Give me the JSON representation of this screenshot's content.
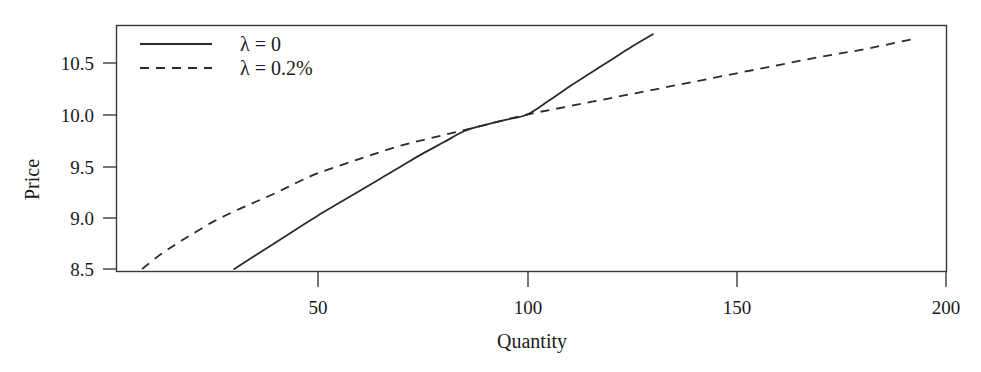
{
  "chart_data": {
    "type": "line",
    "title": "",
    "subtitle": "",
    "xlabel": "Quantity",
    "ylabel": "Price",
    "xlim": [
      5,
      200
    ],
    "ylim": [
      8.4,
      10.85
    ],
    "xticks": [
      50,
      100,
      150,
      200
    ],
    "xtick_labels": [
      "50",
      "100",
      "150",
      "200"
    ],
    "yticks": [
      8.5,
      9.0,
      9.5,
      10.0,
      10.5
    ],
    "ytick_labels": [
      "8.5",
      "10.0",
      "9.5",
      "9.0",
      "8.5"
    ],
    "ytick_labels_ordered": [
      "10.5",
      "10.0",
      "9.5",
      "9.0",
      "8.5"
    ],
    "grid": false,
    "legend_position": "top-left",
    "legend_entries": [
      "λ = 0",
      "λ = 0.2%"
    ],
    "annotations": [
      "Curves intersect at Quantity = 100, Price = 10.0"
    ],
    "series": [
      {
        "name": "λ = 0",
        "style": "solid",
        "color": "#2b2b2b",
        "x": [
          30,
          35,
          40,
          45,
          50,
          55,
          60,
          65,
          70,
          75,
          80,
          85,
          90,
          95,
          100,
          105,
          110,
          115,
          120,
          125,
          130
        ],
        "values": [
          8.5,
          8.63,
          8.76,
          8.89,
          9.02,
          9.14,
          9.26,
          9.38,
          9.5,
          9.62,
          9.73,
          9.84,
          9.9,
          9.95,
          10.0,
          10.13,
          10.27,
          10.4,
          10.53,
          10.66,
          10.78
        ]
      },
      {
        "name": "λ = 0.2%",
        "style": "dashed",
        "color": "#2b2b2b",
        "x": [
          8,
          12,
          16,
          20,
          25,
          30,
          35,
          40,
          45,
          50,
          60,
          70,
          80,
          90,
          100,
          110,
          120,
          130,
          140,
          150,
          160,
          170,
          180,
          193
        ],
        "values": [
          8.5,
          8.63,
          8.74,
          8.84,
          8.96,
          9.06,
          9.15,
          9.24,
          9.34,
          9.43,
          9.57,
          9.7,
          9.8,
          9.9,
          10.0,
          10.08,
          10.16,
          10.24,
          10.32,
          10.4,
          10.48,
          10.56,
          10.63,
          10.74
        ]
      }
    ]
  },
  "axes": {
    "ytick_labels": [
      "10.5",
      "10.0",
      "9.5",
      "9.0",
      "8.5"
    ],
    "xtick_labels": [
      "50",
      "100",
      "150",
      "200"
    ],
    "ylabel": "Price",
    "xlabel": "Quantity"
  },
  "legend": {
    "entries": [
      {
        "label": "λ = 0",
        "style": "solid"
      },
      {
        "label": "λ = 0.2%",
        "style": "dashed"
      }
    ]
  },
  "colors": {
    "line": "#2b2b2b",
    "frame": "#3a3a3a",
    "text": "#1a1a1a",
    "background": "#ffffff"
  }
}
